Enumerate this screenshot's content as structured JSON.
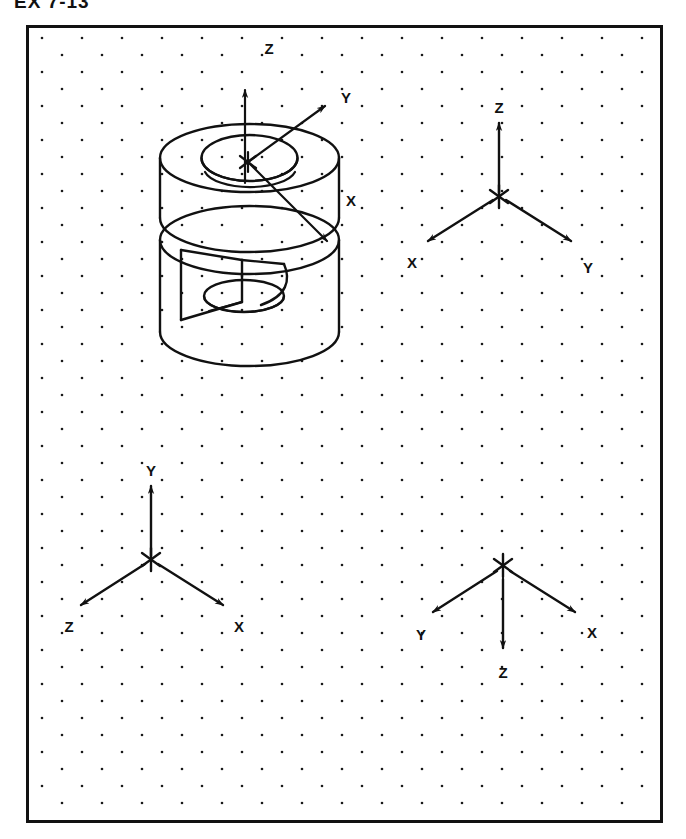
{
  "header": {
    "exercise_number": "EX 7-13",
    "clipped": true
  },
  "frame": {
    "border_color": "#111111",
    "background_color": "#ffffff",
    "grid": {
      "style": "isometric-dot-grid",
      "dot_color": "#1a1a1a",
      "dot_radius_px": 1.3,
      "column_spacing_px": 40,
      "row_spacing_px": 17,
      "row_offset_px": 20
    }
  },
  "figures": [
    {
      "id": "pictorial-object",
      "name": "Isometric pictorial of cylindrical part",
      "description": "Cylinder with through bore and rectangular slot, axes originating at an asterisk on the top face",
      "origin_marker": "*",
      "axes": [
        {
          "label": "Z",
          "direction": "up"
        },
        {
          "label": "Y",
          "direction": "upper-right"
        },
        {
          "label": "X",
          "direction": "lower-right"
        }
      ]
    },
    {
      "id": "axes-top-right",
      "name": "Axis orientation A",
      "origin_marker": "*",
      "axes": [
        {
          "label": "Z",
          "direction": "up"
        },
        {
          "label": "X",
          "direction": "lower-left"
        },
        {
          "label": "Y",
          "direction": "lower-right"
        }
      ]
    },
    {
      "id": "axes-bottom-left",
      "name": "Axis orientation B",
      "origin_marker": "*",
      "axes": [
        {
          "label": "Y",
          "direction": "up"
        },
        {
          "label": "Z",
          "direction": "lower-left"
        },
        {
          "label": "X",
          "direction": "lower-right"
        }
      ]
    },
    {
      "id": "axes-bottom-right",
      "name": "Axis orientation C",
      "origin_marker": "*",
      "axes": [
        {
          "label": "Y",
          "direction": "lower-left"
        },
        {
          "label": "Z",
          "direction": "down"
        },
        {
          "label": "X",
          "direction": "lower-right"
        }
      ]
    }
  ],
  "labels": {
    "pictorial": {
      "z": "Z",
      "y": "Y",
      "x": "X",
      "origin": "*"
    },
    "top_right": {
      "z": "Z",
      "x": "X",
      "y": "Y",
      "origin": "*"
    },
    "bottom_left": {
      "y": "Y",
      "z": "Z",
      "x": "X",
      "origin": "*"
    },
    "bottom_right": {
      "y": "Y",
      "z": "Z",
      "x": "X",
      "origin": "*"
    }
  },
  "colors": {
    "ink": "#111111",
    "paper": "#ffffff",
    "grid_dot": "#1a1a1a"
  }
}
